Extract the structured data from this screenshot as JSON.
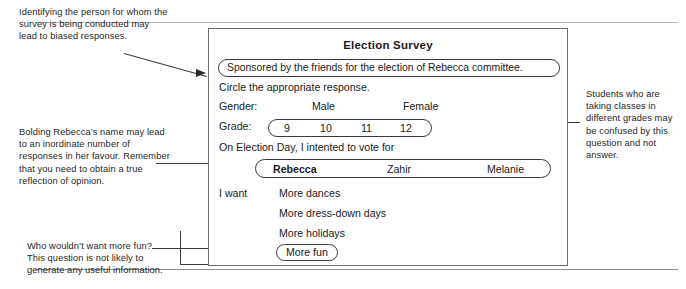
{
  "annotations": {
    "top_left": "Identifying the person for whom the survey is being conducted may lead to biased responses.",
    "middle_left": "Bolding Rebecca’s name may lead to an inordinate number of responses in her favour. Remember that you need to obtain a true reflection of opinion.",
    "bottom_left": "Who wouldn’t want more fun? This question is not likely to generate any useful information.",
    "right": "Students who are taking classes in different grades may be confused by this question and not answer."
  },
  "survey": {
    "title": "Election Survey",
    "sponsor_line": "Sponsored by the friends for the election of Rebecca committee.",
    "instruction": "Circle the appropriate response.",
    "gender": {
      "label": "Gender:",
      "option_male": "Male",
      "option_female": "Female"
    },
    "grade": {
      "label": "Grade:",
      "options": [
        "9",
        "10",
        "11",
        "12"
      ]
    },
    "vote_prompt": "On Election Day, I intented to vote for",
    "candidates": [
      "Rebecca",
      "Zahir",
      "Melanie"
    ],
    "wants_label": "I want",
    "wants": [
      "More dances",
      "More dress-down days",
      "More holidays"
    ],
    "wants_circled": "More fun"
  },
  "colors": {
    "ink": "#1a1a1a",
    "card_border": "#6f6f6f",
    "pill_border": "#3a3a3a",
    "connector": "#3b3b3b",
    "rule": "#b9b9b9",
    "background": "#ffffff"
  }
}
